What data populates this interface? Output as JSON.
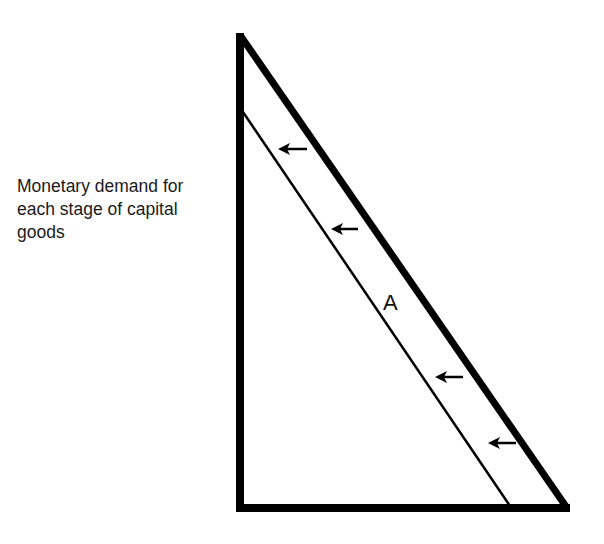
{
  "diagram": {
    "y_axis_label": "Monetary demand for\neach stage of capital\ngoods",
    "region_label": "A",
    "arrow_direction": "left",
    "arrow_count": 4,
    "colors": {
      "line": "#000000",
      "text": "#1a1a1a",
      "background": "#ffffff"
    }
  }
}
